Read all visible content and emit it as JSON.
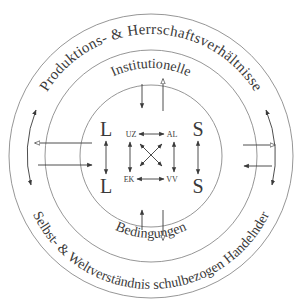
{
  "diagram": {
    "outer_ring": {
      "top_label": "Produktions- & Herrschaftsverhältnisse",
      "bottom_label": "Selbst- & Weltverständnis schulbezogen Handelnder"
    },
    "middle_ring": {
      "top_label": "Institutionelle",
      "bottom_label": "Bedingungen"
    },
    "inner_circle": {
      "left_top": "L",
      "left_bottom": "L",
      "right_top": "S",
      "right_bottom": "S",
      "nodes": {
        "top_left": "UZ",
        "top_right": "AL",
        "bottom_left": "EK",
        "bottom_right": "VV"
      }
    },
    "colors": {
      "ring": "#8a8a8a",
      "ink": "#3a3a3a",
      "background": "#ffffff"
    }
  }
}
